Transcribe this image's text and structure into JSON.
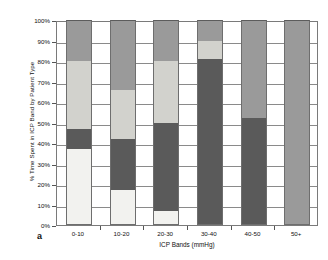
{
  "chart_data": {
    "type": "bar",
    "subtype": "stacked-percentage-column",
    "title": "",
    "panel_label": "a",
    "xlabel": "ICP Bands (mmHg)",
    "ylabel": "% Time Spent in ICP Band by Patient Type",
    "categories": [
      "0-10",
      "10-20",
      "20-30",
      "30-40",
      "40-50",
      "50+"
    ],
    "ylim": [
      0,
      100
    ],
    "ytick_labels": [
      "0%",
      "10%",
      "20%",
      "30%",
      "40%",
      "50%",
      "60%",
      "70%",
      "80%",
      "90%",
      "100%"
    ],
    "ytick_values": [
      0,
      10,
      20,
      30,
      40,
      50,
      60,
      70,
      80,
      90,
      100
    ],
    "grid": true,
    "legend": "none",
    "series": [
      {
        "name": "Series 1",
        "color": "#f2f2ef",
        "values": [
          37,
          17,
          7,
          0,
          0,
          0
        ]
      },
      {
        "name": "Series 2",
        "color": "#5a5a5a",
        "values": [
          10,
          25,
          43,
          81,
          52,
          0
        ]
      },
      {
        "name": "Series 3",
        "color": "#d2d2cd",
        "values": [
          33,
          24,
          30,
          9,
          0,
          0
        ]
      },
      {
        "name": "Series 4",
        "color": "#9a9a9a",
        "values": [
          20,
          34,
          20,
          10,
          48,
          100
        ]
      }
    ],
    "bars": [
      {
        "category": "0-10",
        "segments": [
          {
            "series": "Series 1",
            "from": 0,
            "to": 37,
            "color": "#f2f2ef"
          },
          {
            "series": "Series 2",
            "from": 37,
            "to": 47,
            "color": "#5a5a5a"
          },
          {
            "series": "Series 3",
            "from": 47,
            "to": 80,
            "color": "#d2d2cd"
          },
          {
            "series": "Series 4",
            "from": 80,
            "to": 100,
            "color": "#9a9a9a"
          }
        ]
      },
      {
        "category": "10-20",
        "segments": [
          {
            "series": "Series 1",
            "from": 0,
            "to": 17,
            "color": "#f2f2ef"
          },
          {
            "series": "Series 2",
            "from": 17,
            "to": 42,
            "color": "#5a5a5a"
          },
          {
            "series": "Series 3",
            "from": 42,
            "to": 66,
            "color": "#d2d2cd"
          },
          {
            "series": "Series 4",
            "from": 66,
            "to": 100,
            "color": "#9a9a9a"
          }
        ]
      },
      {
        "category": "20-30",
        "segments": [
          {
            "series": "Series 1",
            "from": 0,
            "to": 7,
            "color": "#f2f2ef"
          },
          {
            "series": "Series 2",
            "from": 7,
            "to": 50,
            "color": "#5a5a5a"
          },
          {
            "series": "Series 3",
            "from": 50,
            "to": 80,
            "color": "#d2d2cd"
          },
          {
            "series": "Series 4",
            "from": 80,
            "to": 100,
            "color": "#9a9a9a"
          }
        ]
      },
      {
        "category": "30-40",
        "segments": [
          {
            "series": "Series 2",
            "from": 0,
            "to": 81,
            "color": "#5a5a5a"
          },
          {
            "series": "Series 3",
            "from": 81,
            "to": 90,
            "color": "#d2d2cd"
          },
          {
            "series": "Series 4",
            "from": 90,
            "to": 100,
            "color": "#9a9a9a"
          }
        ]
      },
      {
        "category": "40-50",
        "segments": [
          {
            "series": "Series 2",
            "from": 0,
            "to": 52,
            "color": "#5a5a5a"
          },
          {
            "series": "Series 4",
            "from": 52,
            "to": 100,
            "color": "#9a9a9a"
          }
        ]
      },
      {
        "category": "50+",
        "segments": [
          {
            "series": "Series 4",
            "from": 0,
            "to": 100,
            "color": "#9a9a9a"
          }
        ]
      }
    ]
  }
}
